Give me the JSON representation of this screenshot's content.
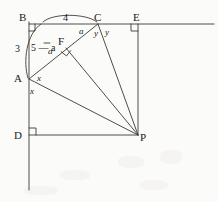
{
  "figure": {
    "stroke_color": "#3a3a3a",
    "background_color": "#fbfbf9",
    "text_color": "#1a1a1a",
    "width": 218,
    "height": 202,
    "points": [
      {
        "id": "B",
        "label": "B",
        "x": 43,
        "y": 24,
        "label_x": 19,
        "label_y": 12
      },
      {
        "id": "C",
        "label": "C",
        "x": 98,
        "y": 24,
        "label_x": 94,
        "label_y": 12
      },
      {
        "id": "E",
        "label": "E",
        "x": 138,
        "y": 24,
        "label_x": 133,
        "label_y": 12
      },
      {
        "id": "A",
        "label": "A",
        "x": 29,
        "y": 79,
        "label_x": 14,
        "label_y": 73
      },
      {
        "id": "F",
        "label": "F",
        "x": 66,
        "y": 48,
        "label_x": 58,
        "label_y": 36
      },
      {
        "id": "D",
        "label": "D",
        "x": 29,
        "y": 135,
        "label_x": 14,
        "label_y": 130
      },
      {
        "id": "P",
        "label": "P",
        "x": 138,
        "y": 135,
        "label_x": 140,
        "label_y": 132
      }
    ],
    "segment_labels": [
      {
        "id": "BC",
        "text": "4",
        "x": 63,
        "y": 13
      },
      {
        "id": "BA",
        "text": "3",
        "x": 15,
        "y": 44
      },
      {
        "id": "AF",
        "text": "5 — a",
        "x": 31,
        "y": 46
      }
    ],
    "angle_labels": [
      {
        "id": "angle-at-C-left",
        "text": "a",
        "x": 79,
        "y": 27
      },
      {
        "id": "angle-at-C-mid",
        "text": "y",
        "x": 94,
        "y": 29
      },
      {
        "id": "angle-at-C-right",
        "text": "y",
        "x": 105,
        "y": 28
      },
      {
        "id": "angle-at-A-upper",
        "text": "x",
        "x": 37,
        "y": 76
      },
      {
        "id": "angle-at-A-lower",
        "text": "x",
        "x": 30,
        "y": 88
      },
      {
        "id": "angle-at-F",
        "text": "a",
        "x": 48,
        "y": 50
      }
    ],
    "right_angles": [
      {
        "id": "right-angle-B",
        "x": 43,
        "y": 24,
        "dir_x": 1,
        "dir_y": 1
      },
      {
        "id": "right-angle-E",
        "x": 138,
        "y": 24,
        "dir_x": -1,
        "dir_y": 1
      },
      {
        "id": "right-angle-D",
        "x": 29,
        "y": 135,
        "dir_x": 1,
        "dir_y": -1
      },
      {
        "id": "right-angle-F",
        "x": 66,
        "y": 48,
        "dir_x": 1,
        "dir_y": 1
      }
    ]
  }
}
